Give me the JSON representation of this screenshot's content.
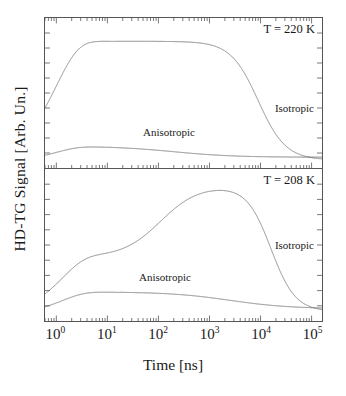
{
  "figure": {
    "xlabel": "Time [ns]",
    "ylabel": "HD-TG Signal [Arb. Un.]"
  },
  "xaxis": {
    "ticks": [
      {
        "label_mantissa": "10",
        "label_exp": "0",
        "value": 1
      },
      {
        "label_mantissa": "10",
        "label_exp": "1",
        "value": 10
      },
      {
        "label_mantissa": "10",
        "label_exp": "2",
        "value": 100
      },
      {
        "label_mantissa": "10",
        "label_exp": "3",
        "value": 1000
      },
      {
        "label_mantissa": "10",
        "label_exp": "4",
        "value": 10000
      },
      {
        "label_mantissa": "10",
        "label_exp": "5",
        "value": 100000
      }
    ]
  },
  "panels": [
    {
      "id": "top",
      "temperature_label": "T = 220 K",
      "iso_label": "Isotropic",
      "aniso_label": "Anisotropic"
    },
    {
      "id": "bottom",
      "temperature_label": "T = 208 K",
      "iso_label": "Isotropic",
      "aniso_label": "Anisotropic"
    }
  ],
  "chart_data": {
    "type": "line",
    "title": "",
    "xlabel": "Time [ns]",
    "ylabel": "HD-TG Signal [Arb. Un.]",
    "xscale": "log",
    "xlim": [
      0.6,
      160000
    ],
    "ylim": [
      0,
      1
    ],
    "grid": false,
    "legend_position": "in-plot annotations",
    "line_color": "#666666",
    "panels": [
      {
        "name": "T = 220 K",
        "temperature_K": 220,
        "series": [
          {
            "name": "Isotropic",
            "model": "damped-acoustic-oscillation-plus-thermal-plateau-decay",
            "rise_time_ns": 1.0,
            "oscillation_period_ns": 1.9,
            "oscillation_damping_time_ns": 9,
            "oscillation_amplitude": 0.47,
            "oscillation_visible_until_ns": 30,
            "plateau_level": 0.88,
            "plateau_range_ns": [
              60,
              900
            ],
            "decay_center_ns": 9000,
            "decay_width_decades": 0.62,
            "final_level": 0.02,
            "peak_value": 0.92,
            "peak_time_ns": 1.9
          },
          {
            "name": "Anisotropic",
            "model": "damped-oscillation-plus-slow-structural-relaxation",
            "rise_time_ns": 1.0,
            "oscillation_period_ns": 1.9,
            "oscillation_damping_time_ns": 9,
            "oscillation_amplitude": 0.055,
            "oscillation_visible_until_ns": 30,
            "plateau_level": 0.12,
            "decay_center_ns": 200,
            "final_level": 0.04,
            "peak_value": 0.16,
            "peak_time_ns": 2.6
          }
        ]
      },
      {
        "name": "T = 208 K",
        "temperature_K": 208,
        "series": [
          {
            "name": "Isotropic",
            "model": "long-lived-damped-acoustic-oscillation-plus-delayed-thermal-peak",
            "rise_time_ns": 1.3,
            "oscillation_period_ns": 2.6,
            "oscillation_damping_time_ns": 45,
            "oscillation_amplitude": 0.46,
            "oscillation_visible_until_ns": 110,
            "peak_value": 0.93,
            "peak_time_ns": 3000,
            "decay_center_ns": 16000,
            "decay_width_decades": 0.55,
            "final_level": 0.03
          },
          {
            "name": "Anisotropic",
            "model": "long-lived-damped-oscillation-plus-slow-relaxation",
            "rise_time_ns": 1.3,
            "oscillation_period_ns": 2.6,
            "oscillation_damping_time_ns": 45,
            "oscillation_amplitude": 0.07,
            "oscillation_visible_until_ns": 110,
            "plateau_level": 0.17,
            "decay_center_ns": 2500,
            "final_level": 0.05,
            "peak_value": 0.21,
            "peak_time_ns": 3.6
          }
        ]
      }
    ]
  }
}
